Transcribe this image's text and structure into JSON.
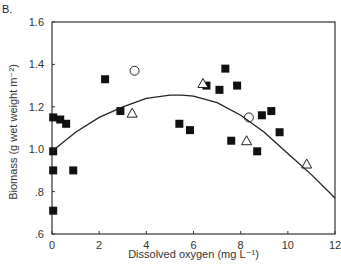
{
  "panel_label": "B.",
  "chart_data": {
    "type": "scatter",
    "title": "",
    "xlabel": "Dissolved oxygen (mg L⁻¹)",
    "ylabel": "Biomass (g wet weight m⁻²)",
    "xlim": [
      0,
      12
    ],
    "ylim": [
      0.6,
      1.6
    ],
    "x_ticks": [
      0,
      2,
      4,
      6,
      8,
      10,
      12
    ],
    "x_tick_labels": [
      "0",
      "2",
      "4",
      "6",
      "8",
      "10",
      "12"
    ],
    "y_ticks": [
      0.6,
      0.8,
      1.0,
      1.2,
      1.4,
      1.6
    ],
    "y_tick_labels": [
      ".6",
      ".8",
      "1.0",
      "1.2",
      "1.4",
      "1.6"
    ],
    "grid": false,
    "legend": null,
    "series": [
      {
        "name": "filled squares",
        "marker": "square-filled",
        "points": [
          [
            0.05,
            1.15
          ],
          [
            0.35,
            1.14
          ],
          [
            0.6,
            1.12
          ],
          [
            0.05,
            0.99
          ],
          [
            0.05,
            0.9
          ],
          [
            0.9,
            0.9
          ],
          [
            0.05,
            0.71
          ],
          [
            2.25,
            1.33
          ],
          [
            2.9,
            1.18
          ],
          [
            5.4,
            1.12
          ],
          [
            5.85,
            1.09
          ],
          [
            6.55,
            1.3
          ],
          [
            7.1,
            1.28
          ],
          [
            7.35,
            1.38
          ],
          [
            7.85,
            1.3
          ],
          [
            7.6,
            1.04
          ],
          [
            8.7,
            0.99
          ],
          [
            8.9,
            1.16
          ],
          [
            9.3,
            1.18
          ],
          [
            9.65,
            1.08
          ]
        ]
      },
      {
        "name": "open circles",
        "marker": "circle-open",
        "points": [
          [
            3.5,
            1.37
          ],
          [
            8.35,
            1.15
          ]
        ]
      },
      {
        "name": "open triangles",
        "marker": "triangle-open",
        "points": [
          [
            3.4,
            1.17
          ],
          [
            6.4,
            1.31
          ],
          [
            8.25,
            1.04
          ],
          [
            10.8,
            0.93
          ]
        ]
      },
      {
        "name": "quadratic fit",
        "type": "line",
        "points": [
          [
            0,
            0.99
          ],
          [
            1,
            1.08
          ],
          [
            2,
            1.15
          ],
          [
            3,
            1.2
          ],
          [
            4,
            1.24
          ],
          [
            5,
            1.255
          ],
          [
            5.5,
            1.255
          ],
          [
            6,
            1.25
          ],
          [
            7,
            1.22
          ],
          [
            8,
            1.16
          ],
          [
            9,
            1.08
          ],
          [
            10,
            0.98
          ],
          [
            11,
            0.88
          ],
          [
            12,
            0.77
          ]
        ]
      }
    ]
  }
}
